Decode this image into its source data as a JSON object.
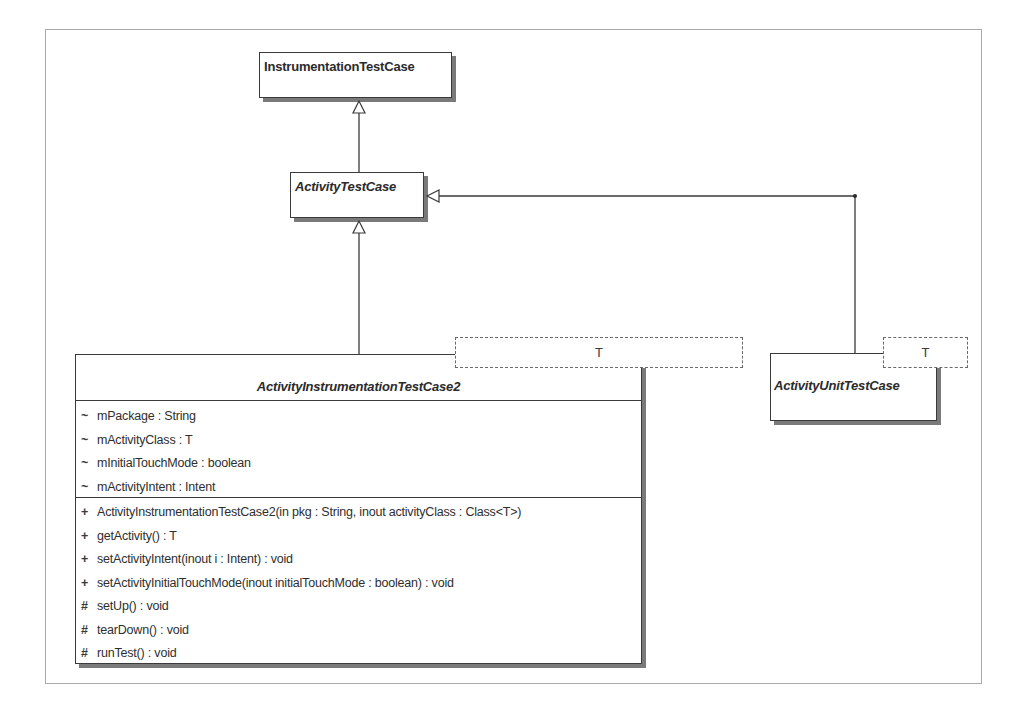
{
  "diagram": {
    "type": "UML class diagram",
    "classes": {
      "instrumentation_test_case": {
        "name": "InstrumentationTestCase",
        "abstract": false
      },
      "activity_test_case": {
        "name": "ActivityTestCase",
        "abstract": true
      },
      "activity_instrumentation_test_case2": {
        "name": "ActivityInstrumentationTestCase2",
        "abstract": true,
        "template_param": "T",
        "attributes": [
          {
            "visibility": "~",
            "text": "mPackage : String"
          },
          {
            "visibility": "~",
            "text": "mActivityClass : T"
          },
          {
            "visibility": "~",
            "text": "mInitialTouchMode : boolean"
          },
          {
            "visibility": "~",
            "text": "mActivityIntent : Intent"
          }
        ],
        "operations": [
          {
            "visibility": "+",
            "text": "ActivityInstrumentationTestCase2(in pkg : String, inout activityClass : Class<T>)"
          },
          {
            "visibility": "+",
            "text": "getActivity() : T"
          },
          {
            "visibility": "+",
            "text": "setActivityIntent(inout i : Intent) : void"
          },
          {
            "visibility": "+",
            "text": "setActivityInitialTouchMode(inout initialTouchMode : boolean) : void"
          },
          {
            "visibility": "#",
            "text": "setUp() : void"
          },
          {
            "visibility": "#",
            "text": "tearDown() : void"
          },
          {
            "visibility": "#",
            "text": "runTest() : void"
          }
        ]
      },
      "activity_unit_test_case": {
        "name": "ActivityUnitTestCase",
        "abstract": true,
        "template_param": "T"
      }
    },
    "relationships": [
      {
        "type": "generalization",
        "from": "ActivityTestCase",
        "to": "InstrumentationTestCase"
      },
      {
        "type": "generalization",
        "from": "ActivityInstrumentationTestCase2",
        "to": "ActivityTestCase"
      },
      {
        "type": "generalization",
        "from": "ActivityUnitTestCase",
        "to": "ActivityTestCase"
      }
    ],
    "colors": {
      "line": "#3a3a3a",
      "shadow": "#7a7a7a",
      "frame": "#a9a9a9",
      "background": "#ffffff"
    }
  }
}
